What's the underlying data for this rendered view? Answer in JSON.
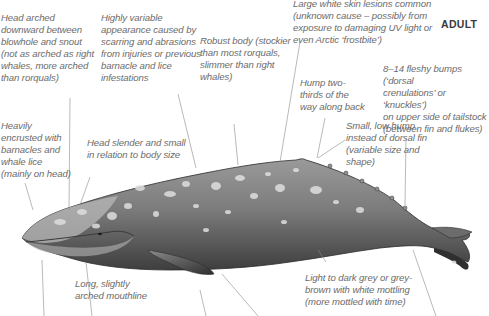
{
  "diagram": {
    "title": "ADULT",
    "annotations": [
      {
        "id": "head-arched",
        "text": "Head arched\ndownward between\nblowhole and snout\n(not as arched as right\nwhales, more arched\nthan rorquals)"
      },
      {
        "id": "variable-appearance",
        "text": "Highly variable\nappearance caused by\nscarring and abrasions\nfrom injuries or previous\nbarnacle and lice\ninfestations"
      },
      {
        "id": "robust-body",
        "text": "Robust body (stockier\nthan most rorquals,\nslimmer than right\nwhales)"
      },
      {
        "id": "skin-lesions",
        "text": "Large white skin lesions common\n(unknown cause – possibly from\nexposure to damaging UV light or\neven Arctic ‘frostbite’)"
      },
      {
        "id": "hump-position",
        "text": "Hump two-\nthirds of the\nway along back"
      },
      {
        "id": "dorsal-crenulations",
        "text": "8–14 fleshy bumps (‘dorsal\ncrenulations’ or ‘knuckles’)\non upper side of tailstock\n(between fin and flukes)"
      },
      {
        "id": "barnacles",
        "text": "Heavily\nencrusted with\nbarnacles and\nwhale lice\n(mainly on head)"
      },
      {
        "id": "head-slender",
        "text": "Head slender and small\nin relation to body size"
      },
      {
        "id": "low-hump",
        "text": "Small, low hump\ninstead of dorsal fin\n(variable size and\nshape)"
      },
      {
        "id": "mouthline",
        "text": "Long, slightly\narched mouthline"
      },
      {
        "id": "coloration",
        "text": "Light to dark grey or grey-\nbrown with white mottling\n(more mottled with time)"
      }
    ],
    "colors": {
      "text": "#6b6b6b",
      "leader_line": "#8a8a8a",
      "whale_body": "#7a7a7a",
      "whale_dark": "#3c3c3c",
      "mottling": "#d8d8d8"
    }
  }
}
